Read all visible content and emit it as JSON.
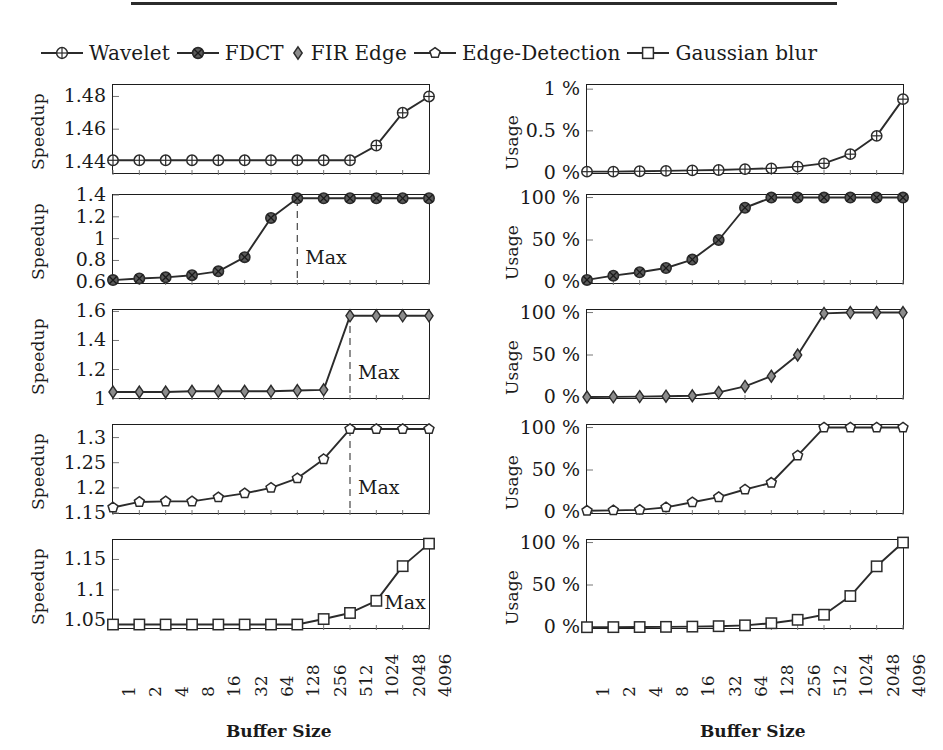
{
  "figure": {
    "x_axis_title": "Buffer Size",
    "x_categories": [
      "1",
      "2",
      "4",
      "8",
      "16",
      "32",
      "64",
      "128",
      "256",
      "512",
      "1024",
      "2048",
      "4096"
    ],
    "left_y_label": "Speedup",
    "right_y_label": "Usage",
    "max_label": "Max",
    "line_color": "#2b2b2b",
    "axis_color": "#1d1d1d",
    "background": "#ffffff"
  },
  "legend": {
    "items": [
      {
        "label": "Wavelet",
        "marker": "circle-cross-icon",
        "has_line": true
      },
      {
        "label": "FDCT",
        "marker": "circle-filled-cross-icon",
        "has_line": true
      },
      {
        "label": "FIR Edge",
        "marker": "diamond-icon",
        "has_line": false
      },
      {
        "label": "Edge-Detection",
        "marker": "pentagon-icon",
        "has_line": true
      },
      {
        "label": "Gaussian blur",
        "marker": "square-icon",
        "has_line": true
      }
    ]
  },
  "chart_data": [
    {
      "type": "line",
      "title": "Wavelet Speedup",
      "series_name": "Wavelet",
      "marker": "circle-cross-icon",
      "xlabel": "Buffer Size",
      "ylabel": "Speedup",
      "x": [
        "1",
        "2",
        "4",
        "8",
        "16",
        "32",
        "64",
        "128",
        "256",
        "512",
        "1024",
        "2048",
        "4096"
      ],
      "values": [
        1.441,
        1.441,
        1.441,
        1.441,
        1.441,
        1.441,
        1.441,
        1.441,
        1.441,
        1.441,
        1.45,
        1.47,
        1.48
      ],
      "yticks": [
        "1.44",
        "1.46",
        "1.48"
      ],
      "ytickvals": [
        1.44,
        1.46,
        1.48
      ],
      "ylim": [
        1.432,
        1.487
      ],
      "grid": false,
      "max_line_index": null
    },
    {
      "type": "line",
      "title": "FDCT Speedup",
      "series_name": "FDCT",
      "marker": "circle-filled-cross-icon",
      "xlabel": "Buffer Size",
      "ylabel": "Speedup",
      "x": [
        "1",
        "2",
        "4",
        "8",
        "16",
        "32",
        "64",
        "128",
        "256",
        "512",
        "1024",
        "2048",
        "4096"
      ],
      "values": [
        0.62,
        0.635,
        0.645,
        0.665,
        0.7,
        0.83,
        1.19,
        1.37,
        1.37,
        1.37,
        1.37,
        1.37,
        1.37
      ],
      "yticks": [
        "0.6",
        "0.8",
        "1",
        "1.2",
        "1.4"
      ],
      "ytickvals": [
        0.6,
        0.8,
        1.0,
        1.2,
        1.4
      ],
      "ylim": [
        0.575,
        1.4
      ],
      "grid": false,
      "max_line_index": 7
    },
    {
      "type": "line",
      "title": "FIR Edge Speedup",
      "series_name": "FIR Edge",
      "marker": "diamond-icon",
      "xlabel": "Buffer Size",
      "ylabel": "Speedup",
      "x": [
        "1",
        "2",
        "4",
        "8",
        "16",
        "32",
        "64",
        "128",
        "256",
        "512",
        "1024",
        "2048",
        "4096"
      ],
      "values": [
        1.045,
        1.045,
        1.045,
        1.05,
        1.05,
        1.05,
        1.05,
        1.055,
        1.06,
        1.57,
        1.57,
        1.57,
        1.57
      ],
      "yticks": [
        "1",
        "1.2",
        "1.4",
        "1.6"
      ],
      "ytickvals": [
        1.0,
        1.2,
        1.4,
        1.6
      ],
      "ylim": [
        0.99,
        1.61
      ],
      "grid": false,
      "max_line_index": 9
    },
    {
      "type": "line",
      "title": "Edge-Detection Speedup",
      "series_name": "Edge-Detection",
      "marker": "pentagon-icon",
      "xlabel": "Buffer Size",
      "ylabel": "Speedup",
      "x": [
        "1",
        "2",
        "4",
        "8",
        "16",
        "32",
        "64",
        "128",
        "256",
        "512",
        "1024",
        "2048",
        "4096"
      ],
      "values": [
        1.161,
        1.172,
        1.173,
        1.173,
        1.181,
        1.189,
        1.2,
        1.219,
        1.257,
        1.317,
        1.317,
        1.317,
        1.317
      ],
      "yticks": [
        "1.15",
        "1.2",
        "1.25",
        "1.3"
      ],
      "ytickvals": [
        1.15,
        1.2,
        1.25,
        1.3
      ],
      "ylim": [
        1.146,
        1.325
      ],
      "grid": false,
      "max_line_index": 9
    },
    {
      "type": "line",
      "title": "Gaussian blur Speedup",
      "series_name": "Gaussian blur",
      "marker": "square-icon",
      "xlabel": "Buffer Size",
      "ylabel": "Speedup",
      "x": [
        "1",
        "2",
        "4",
        "8",
        "16",
        "32",
        "64",
        "128",
        "256",
        "512",
        "1024",
        "2048",
        "4096"
      ],
      "values": [
        1.043,
        1.043,
        1.043,
        1.043,
        1.043,
        1.043,
        1.043,
        1.043,
        1.052,
        1.062,
        1.082,
        1.139,
        1.176
      ],
      "yticks": [
        "1.05",
        "1.1",
        "1.15"
      ],
      "ytickvals": [
        1.05,
        1.1,
        1.15
      ],
      "ylim": [
        1.034,
        1.182
      ],
      "grid": false,
      "max_line_index": null
    },
    {
      "type": "line",
      "title": "Wavelet Usage",
      "series_name": "Wavelet",
      "marker": "circle-cross-icon",
      "xlabel": "Buffer Size",
      "ylabel": "Usage",
      "x": [
        "1",
        "2",
        "4",
        "8",
        "16",
        "32",
        "64",
        "128",
        "256",
        "512",
        "1024",
        "2048",
        "4096"
      ],
      "values": [
        0.01,
        0.01,
        0.015,
        0.02,
        0.025,
        0.03,
        0.04,
        0.05,
        0.07,
        0.11,
        0.22,
        0.44,
        0.88
      ],
      "yticks": [
        "0 %",
        "0.5 %",
        "1 %"
      ],
      "ytickvals": [
        0,
        0.5,
        1.0
      ],
      "ylim": [
        -0.03,
        1.05
      ],
      "grid": false,
      "max_line_index": null
    },
    {
      "type": "line",
      "title": "FDCT Usage",
      "series_name": "FDCT",
      "marker": "circle-filled-cross-icon",
      "xlabel": "Buffer Size",
      "ylabel": "Usage",
      "x": [
        "1",
        "2",
        "4",
        "8",
        "16",
        "32",
        "64",
        "128",
        "256",
        "512",
        "1024",
        "2048",
        "4096"
      ],
      "values": [
        3,
        8,
        12,
        17,
        27,
        50,
        88,
        100,
        100,
        100,
        100,
        100,
        100
      ],
      "yticks": [
        "0 %",
        "50 %",
        "100 %"
      ],
      "ytickvals": [
        0,
        50,
        100
      ],
      "ylim": [
        -3,
        103
      ],
      "grid": false,
      "max_line_index": null
    },
    {
      "type": "line",
      "title": "FIR Edge Usage",
      "series_name": "FIR Edge",
      "marker": "diamond-icon",
      "xlabel": "Buffer Size",
      "ylabel": "Usage",
      "x": [
        "1",
        "2",
        "4",
        "8",
        "16",
        "32",
        "64",
        "128",
        "256",
        "512",
        "1024",
        "2048",
        "4096"
      ],
      "values": [
        0.5,
        0.7,
        1,
        1.5,
        2,
        6,
        13,
        25,
        50,
        99,
        100,
        100,
        100
      ],
      "yticks": [
        "0 %",
        "50 %",
        "100 %"
      ],
      "ytickvals": [
        0,
        50,
        100
      ],
      "ylim": [
        -3,
        103
      ],
      "grid": false,
      "max_line_index": null
    },
    {
      "type": "line",
      "title": "Edge-Detection Usage",
      "series_name": "Edge-Detection",
      "marker": "pentagon-icon",
      "xlabel": "Buffer Size",
      "ylabel": "Usage",
      "x": [
        "1",
        "2",
        "4",
        "8",
        "16",
        "32",
        "64",
        "128",
        "256",
        "512",
        "1024",
        "2048",
        "4096"
      ],
      "values": [
        2,
        2.5,
        3,
        6,
        12,
        18,
        27,
        35,
        67,
        100,
        100,
        100,
        100
      ],
      "yticks": [
        "0 %",
        "50 %",
        "100 %"
      ],
      "ytickvals": [
        0,
        50,
        100
      ],
      "ylim": [
        -3,
        103
      ],
      "grid": false,
      "max_line_index": null
    },
    {
      "type": "line",
      "title": "Gaussian blur Usage",
      "series_name": "Gaussian blur",
      "marker": "square-icon",
      "xlabel": "Buffer Size",
      "ylabel": "Usage",
      "x": [
        "1",
        "2",
        "4",
        "8",
        "16",
        "32",
        "64",
        "128",
        "256",
        "512",
        "1024",
        "2048",
        "4096"
      ],
      "values": [
        0.3,
        0.4,
        0.5,
        0.7,
        1,
        1.5,
        2.5,
        5,
        9,
        15,
        37,
        72,
        100
      ],
      "yticks": [
        "0 %",
        "50 %",
        "100 %"
      ],
      "ytickvals": [
        0,
        50,
        100
      ],
      "ylim": [
        -3,
        103
      ],
      "grid": false,
      "max_line_index": null
    }
  ]
}
